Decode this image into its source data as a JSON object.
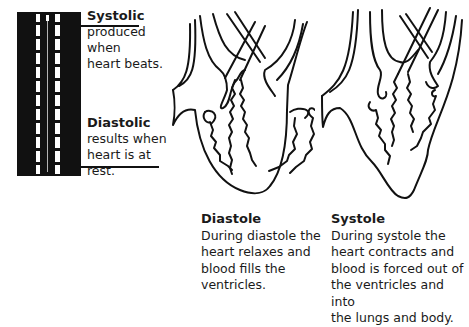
{
  "gauge": {
    "systolic": {
      "title": "Systolic",
      "lines": [
        "produced when",
        "heart beats."
      ]
    },
    "diastolic": {
      "title": "Diastolic",
      "lines": [
        "results when",
        "heart is at rest."
      ]
    }
  },
  "panels": [
    {
      "id": "diastole",
      "title": "Diastole",
      "lines": [
        "During diastole the",
        "heart relaxes and",
        "blood fills the",
        "ventricles."
      ]
    },
    {
      "id": "systole",
      "title": "Systole",
      "lines": [
        "During systole the",
        "heart contracts and",
        "blood is forced out of",
        "the ventricles and into",
        "the lungs and body."
      ]
    }
  ],
  "colors": {
    "ink": "#111111",
    "background": "#ffffff"
  }
}
